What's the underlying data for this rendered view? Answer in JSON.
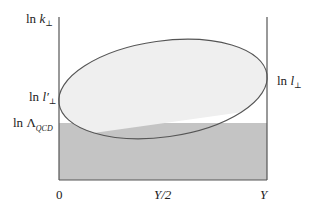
{
  "diagram": {
    "type": "phase-space region",
    "y_axis_labels": {
      "top": {
        "prefix": "ln",
        "symbol": "k",
        "subscript": "⊥"
      },
      "lower": {
        "prefix": "ln",
        "symbol": "l′",
        "subscript": "⊥"
      },
      "qcd": {
        "prefix": "ln",
        "symbol": "Λ",
        "subscript": "QCD"
      }
    },
    "right_axis_label": {
      "prefix": "ln",
      "symbol": "l",
      "subscript": "⊥"
    },
    "x_axis_ticks": [
      "0",
      "Y/2",
      "Y"
    ],
    "regions": {
      "ellipse_fill": "#efefef",
      "nonperturbative_band_fill": "#c4c4c4",
      "line_color": "#555555"
    }
  }
}
